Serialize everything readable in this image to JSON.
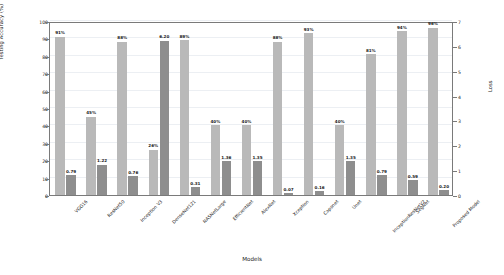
{
  "chart_data": {
    "type": "bar",
    "title": "",
    "xlabel": "Models",
    "ylabel": "Testing Accuracy (%)",
    "y2label": "Loss",
    "ylim": [
      0,
      100
    ],
    "y2lim": [
      0,
      7
    ],
    "grid": true,
    "legend": null,
    "categories": [
      "VGG16",
      "ResNet50",
      "Inception V3",
      "DenseNet121",
      "NASNetLarge",
      "EfficientNet",
      "AlexNet",
      "Xception",
      "Capsnet",
      "Unet",
      "InceptionResNetV2",
      "SegNet",
      "Proposed Model"
    ],
    "yticks_left": [
      0,
      10,
      20,
      30,
      40,
      50,
      60,
      70,
      80,
      90,
      100
    ],
    "yticks_right": [
      0,
      1,
      2,
      3,
      4,
      5,
      6,
      7
    ],
    "series": [
      {
        "name": "Testing Accuracy (%)",
        "axis": "left",
        "color": "#b9b9b9",
        "values": [
          91,
          45,
          88,
          26,
          89,
          40,
          40,
          88,
          93,
          40,
          81,
          94,
          96
        ],
        "labels": [
          "91%",
          "45%",
          "88%",
          "26%",
          "89%",
          "40%",
          "40%",
          "88%",
          "93%",
          "40%",
          "81%",
          "94%",
          "96%"
        ]
      },
      {
        "name": "Loss",
        "axis": "right",
        "color": "#8e8e8e",
        "values": [
          0.79,
          1.22,
          0.76,
          6.2,
          0.31,
          1.36,
          1.35,
          0.07,
          0.16,
          1.35,
          0.79,
          0.59,
          0.2
        ],
        "labels": [
          "0.79",
          "1.22",
          "0.76",
          "6.20",
          "0.31",
          "1.36",
          "1.35",
          "0.07",
          "0.16",
          "1.35",
          "0.79",
          "0.59",
          "0.20"
        ]
      }
    ]
  }
}
